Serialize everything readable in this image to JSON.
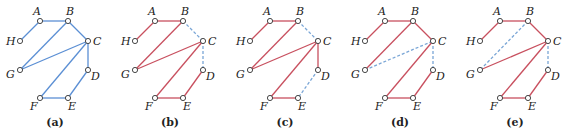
{
  "figure": {
    "colors": {
      "original_edge": "#5b8fd4",
      "tree_edge": "#c8505f",
      "removed_edge": "#7aa6d6",
      "node_fill": "#ffffff",
      "node_stroke": "#333333"
    },
    "nodes": [
      {
        "id": "A",
        "x": 40,
        "y": 21,
        "lx": 33,
        "ly": 15
      },
      {
        "id": "B",
        "x": 68,
        "y": 21,
        "lx": 66,
        "ly": 15
      },
      {
        "id": "C",
        "x": 88,
        "y": 41,
        "lx": 93,
        "ly": 45
      },
      {
        "id": "D",
        "x": 88,
        "y": 70,
        "lx": 91,
        "ly": 80
      },
      {
        "id": "E",
        "x": 68,
        "y": 98,
        "lx": 68,
        "ly": 110
      },
      {
        "id": "F",
        "x": 40,
        "y": 98,
        "lx": 30,
        "ly": 110
      },
      {
        "id": "G",
        "x": 20,
        "y": 70,
        "lx": 6,
        "ly": 78
      },
      {
        "id": "H",
        "x": 20,
        "y": 41,
        "lx": 6,
        "ly": 45
      }
    ],
    "panels": [
      {
        "caption": "(a)",
        "offset_x": 0,
        "edges": [
          {
            "from": "H",
            "to": "A",
            "style": "original"
          },
          {
            "from": "A",
            "to": "B",
            "style": "original"
          },
          {
            "from": "B",
            "to": "C",
            "style": "original"
          },
          {
            "from": "B",
            "to": "G",
            "style": "original"
          },
          {
            "from": "C",
            "to": "G",
            "style": "original"
          },
          {
            "from": "C",
            "to": "F",
            "style": "original"
          },
          {
            "from": "C",
            "to": "D",
            "style": "original"
          },
          {
            "from": "D",
            "to": "E",
            "style": "original"
          },
          {
            "from": "E",
            "to": "F",
            "style": "original"
          }
        ]
      },
      {
        "caption": "(b)",
        "offset_x": 115,
        "edges": [
          {
            "from": "H",
            "to": "A",
            "style": "tree"
          },
          {
            "from": "A",
            "to": "B",
            "style": "tree"
          },
          {
            "from": "B",
            "to": "G",
            "style": "tree"
          },
          {
            "from": "G",
            "to": "C",
            "style": "tree"
          },
          {
            "from": "C",
            "to": "F",
            "style": "tree"
          },
          {
            "from": "F",
            "to": "E",
            "style": "tree"
          },
          {
            "from": "E",
            "to": "D",
            "style": "tree"
          },
          {
            "from": "B",
            "to": "C",
            "style": "removed"
          },
          {
            "from": "C",
            "to": "D",
            "style": "removed"
          }
        ]
      },
      {
        "caption": "(c)",
        "offset_x": 230,
        "edges": [
          {
            "from": "H",
            "to": "A",
            "style": "tree"
          },
          {
            "from": "A",
            "to": "B",
            "style": "tree"
          },
          {
            "from": "B",
            "to": "G",
            "style": "tree"
          },
          {
            "from": "G",
            "to": "C",
            "style": "tree"
          },
          {
            "from": "C",
            "to": "F",
            "style": "tree"
          },
          {
            "from": "F",
            "to": "E",
            "style": "tree"
          },
          {
            "from": "C",
            "to": "D",
            "style": "tree"
          },
          {
            "from": "B",
            "to": "C",
            "style": "removed"
          },
          {
            "from": "D",
            "to": "E",
            "style": "removed"
          }
        ]
      },
      {
        "caption": "(d)",
        "offset_x": 345,
        "edges": [
          {
            "from": "H",
            "to": "A",
            "style": "tree"
          },
          {
            "from": "A",
            "to": "B",
            "style": "tree"
          },
          {
            "from": "B",
            "to": "C",
            "style": "tree"
          },
          {
            "from": "B",
            "to": "G",
            "style": "tree"
          },
          {
            "from": "C",
            "to": "F",
            "style": "tree"
          },
          {
            "from": "F",
            "to": "E",
            "style": "tree"
          },
          {
            "from": "E",
            "to": "D",
            "style": "tree"
          },
          {
            "from": "G",
            "to": "C",
            "style": "removed"
          },
          {
            "from": "C",
            "to": "D",
            "style": "removed"
          }
        ]
      },
      {
        "caption": "(e)",
        "offset_x": 460,
        "edges": [
          {
            "from": "H",
            "to": "A",
            "style": "tree"
          },
          {
            "from": "A",
            "to": "B",
            "style": "tree"
          },
          {
            "from": "B",
            "to": "C",
            "style": "tree"
          },
          {
            "from": "G",
            "to": "C",
            "style": "tree"
          },
          {
            "from": "C",
            "to": "F",
            "style": "tree"
          },
          {
            "from": "F",
            "to": "E",
            "style": "tree"
          },
          {
            "from": "E",
            "to": "D",
            "style": "tree"
          },
          {
            "from": "B",
            "to": "G",
            "style": "removed"
          },
          {
            "from": "C",
            "to": "D",
            "style": "removed"
          }
        ]
      }
    ]
  }
}
